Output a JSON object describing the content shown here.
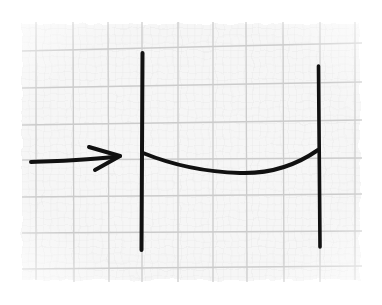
{
  "diagram": {
    "description": "Hand-drawn sketch on graph paper: an arrow pointing into the left of two vertical lines, connected by a sagging curved line",
    "colors": {
      "background": "#ffffff",
      "paper": "#f7f7f7",
      "grid_major": "#cfcfcf",
      "grid_minor": "#e6e6e6",
      "ink": "#111111"
    },
    "elements": [
      {
        "id": "left-vertical-line",
        "type": "line",
        "from": [
          142,
          52
        ],
        "to": [
          142,
          250
        ]
      },
      {
        "id": "right-vertical-line",
        "type": "line",
        "from": [
          319,
          65
        ],
        "to": [
          320,
          248
        ]
      },
      {
        "id": "sagging-curve",
        "type": "curve",
        "from": [
          143,
          153
        ],
        "via": [
          230,
          173
        ],
        "to": [
          318,
          150
        ]
      },
      {
        "id": "input-arrow",
        "type": "arrow",
        "from": [
          30,
          162
        ],
        "to": [
          121,
          156
        ]
      }
    ]
  }
}
